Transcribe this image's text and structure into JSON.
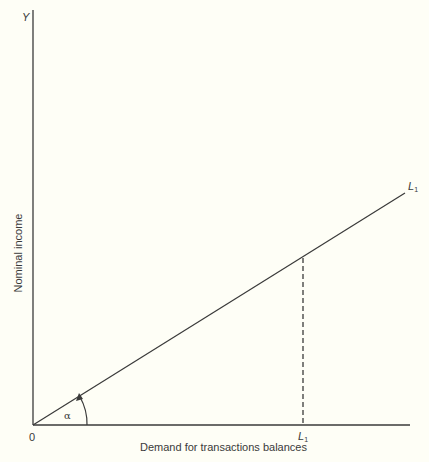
{
  "diagram": {
    "y_axis": {
      "symbol": "Y",
      "title": "Nominal income"
    },
    "x_axis": {
      "title": "Demand for transactions balances",
      "tick_label": "L",
      "tick_label_sub": "1"
    },
    "origin_label": "0",
    "line": {
      "label": "L",
      "label_sub": "1",
      "description": "straight line from origin, slope angle alpha"
    },
    "angle_label": "α",
    "dashed_guide": {
      "description": "vertical dashed line from L1 curve down to x-axis at L1"
    },
    "colors": {
      "background": "#fefef6",
      "ink": "#3a3a3a"
    }
  }
}
